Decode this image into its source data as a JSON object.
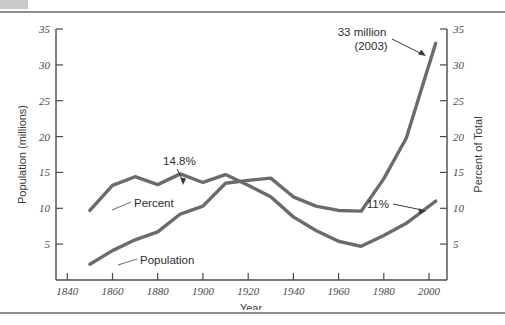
{
  "figure": {
    "background_color": "#ffffff",
    "rule_color": "#8d8d8d",
    "corner_tab_color": "#c9c9c9"
  },
  "chart_data": {
    "type": "line",
    "title": "",
    "xlabel": "Year",
    "ylabel": "Population (millions)",
    "y2label": "Percent of Total",
    "xlim": [
      1835,
      2008
    ],
    "ylim": [
      0,
      35
    ],
    "y2lim": [
      0,
      35
    ],
    "grid": false,
    "legend_position": "inline-labels",
    "line_color": "#6b6b6b",
    "xticks": [
      1840,
      1860,
      1880,
      1900,
      1920,
      1940,
      1960,
      1980,
      2000
    ],
    "xticklabels": [
      "1840",
      "1860",
      "1880",
      "1900",
      "1920",
      "1940",
      "1960",
      "1980",
      "2000"
    ],
    "yticks": [
      5,
      10,
      15,
      20,
      25,
      30,
      35
    ],
    "yticklabels": [
      "5",
      "10",
      "15",
      "20",
      "25",
      "30",
      "35"
    ],
    "y2ticks": [
      5,
      10,
      15,
      20,
      25,
      30,
      35
    ],
    "y2ticklabels": [
      "5",
      "10",
      "15",
      "20",
      "25",
      "30",
      "35"
    ],
    "series": [
      {
        "name": "Population",
        "axis": "left",
        "unit": "millions",
        "x": [
          1850,
          1860,
          1870,
          1880,
          1890,
          1900,
          1910,
          1920,
          1930,
          1940,
          1950,
          1960,
          1970,
          1980,
          1990,
          2003
        ],
        "values": [
          2.2,
          4.1,
          5.6,
          6.7,
          9.2,
          10.3,
          13.5,
          13.9,
          14.2,
          11.6,
          10.3,
          9.7,
          9.6,
          14.1,
          19.8,
          33.0
        ]
      },
      {
        "name": "Percent",
        "axis": "right",
        "unit": "percent of total",
        "x": [
          1850,
          1860,
          1870,
          1880,
          1890,
          1900,
          1910,
          1920,
          1930,
          1940,
          1950,
          1960,
          1970,
          1980,
          1990,
          2003
        ],
        "values": [
          9.7,
          13.2,
          14.4,
          13.3,
          14.8,
          13.6,
          14.7,
          13.2,
          11.6,
          8.8,
          6.9,
          5.4,
          4.7,
          6.2,
          7.9,
          11.0
        ]
      }
    ],
    "annotations": [
      {
        "text": "14.8%",
        "series": "Percent",
        "x": 1890,
        "value": 14.8
      },
      {
        "text": "33 million",
        "series": "Population",
        "x": 2003,
        "value": 33.0
      },
      {
        "text": "(2003)",
        "series": "Population",
        "x": 2003,
        "value": 33.0
      },
      {
        "text": "11%",
        "series": "Percent",
        "x": 2003,
        "value": 11.0
      }
    ],
    "inline_labels": [
      {
        "text": "Percent",
        "series": "Percent"
      },
      {
        "text": "Population",
        "series": "Population"
      }
    ]
  },
  "labels": {
    "y_axis_title": "Population (millions)",
    "y2_axis_title": "Percent of Total",
    "x_axis_title": "Year",
    "percent_series": "Percent",
    "population_series": "Population",
    "annot_peak_percent": "14.8%",
    "annot_pop_value": "33 million",
    "annot_pop_year": "(2003)",
    "annot_end_percent": "11%",
    "y_t_35": "35",
    "y_t_30": "30",
    "y_t_25": "25",
    "y_t_20": "20",
    "y_t_15": "15",
    "y_t_10": "10",
    "y_t_5": "5",
    "y2_t_35": "35",
    "y2_t_30": "30",
    "y2_t_25": "25",
    "y2_t_20": "20",
    "y2_t_15": "15",
    "y2_t_10": "10",
    "y2_t_5": "5",
    "x_t_1840": "1840",
    "x_t_1860": "1860",
    "x_t_1880": "1880",
    "x_t_1900": "1900",
    "x_t_1920": "1920",
    "x_t_1940": "1940",
    "x_t_1960": "1960",
    "x_t_1980": "1980",
    "x_t_2000": "2000"
  }
}
